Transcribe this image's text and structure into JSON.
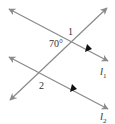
{
  "diagram": {
    "line_color": "#8a8a8a",
    "marker_color": "#111111",
    "labels": {
      "angle1": "1",
      "angle70": "70°",
      "angle2": "2",
      "line1_letter": "l",
      "line1_sub": "1",
      "line2_letter": "l",
      "line2_sub": "2"
    }
  }
}
